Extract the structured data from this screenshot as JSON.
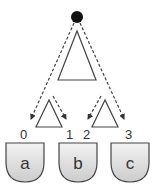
{
  "diagram": {
    "root": {
      "shape": "filled-circle",
      "color": "#111111"
    },
    "top_subtree": {
      "shape": "triangle"
    },
    "left_subtree": {
      "shape": "triangle"
    },
    "right_subtree": {
      "shape": "triangle"
    },
    "edge_style": "dashed-arrow",
    "edge_labels": [
      "0",
      "1",
      "2",
      "3"
    ],
    "leaves": [
      {
        "label": "a"
      },
      {
        "label": "b"
      },
      {
        "label": "c"
      }
    ],
    "colors": {
      "stroke": "#444444",
      "shield_top": "#f0f0f0",
      "shield_bottom": "#cfcfcf"
    }
  }
}
